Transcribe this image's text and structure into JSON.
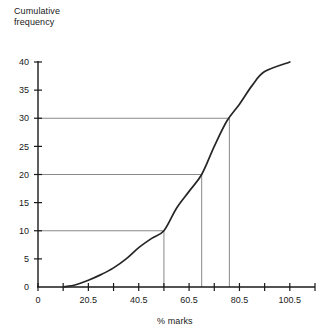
{
  "chart_data": {
    "type": "line",
    "title": "",
    "xlabel": "% marks",
    "ylabel": "Cumulative\nfrequency",
    "ylabel_line1": "Cumulative",
    "ylabel_line2": "frequency",
    "xlim": [
      0.5,
      110.5
    ],
    "ylim": [
      0,
      40
    ],
    "grid": false,
    "legend": null,
    "y_ticks": [
      0,
      5,
      10,
      15,
      20,
      25,
      30,
      35,
      40
    ],
    "y_tick_labels": [
      "0",
      "5",
      "10",
      "15",
      "20",
      "25",
      "30",
      "35",
      "40"
    ],
    "x_ticks": [
      0.5,
      10.5,
      20.5,
      30.5,
      40.5,
      50.5,
      60.5,
      70.5,
      80.5,
      90.5,
      100.5,
      110.5
    ],
    "x_tick_labels": [
      "0",
      "",
      "20.5",
      "",
      "40.5",
      "",
      "60.5",
      "",
      "80.5",
      "",
      "100.5",
      ""
    ],
    "x_labeled_ticks": [
      {
        "value": 0.5,
        "label": "0"
      },
      {
        "value": 20.5,
        "label": "20.5"
      },
      {
        "value": 40.5,
        "label": "40.5"
      },
      {
        "value": 60.5,
        "label": "60.5"
      },
      {
        "value": 80.5,
        "label": "80.5"
      },
      {
        "value": 100.5,
        "label": "100.5"
      }
    ],
    "series": [
      {
        "name": "Cumulative frequency curve",
        "x": [
          10.5,
          15.5,
          20.5,
          25.5,
          30.5,
          35.5,
          40.5,
          45.5,
          50.5,
          55.5,
          60.5,
          65.5,
          70.5,
          75.5,
          80.5,
          85.5,
          90.5,
          100.5
        ],
        "values": [
          0,
          0.4,
          1.2,
          2.2,
          3.4,
          5.0,
          7.0,
          8.6,
          10.0,
          14.0,
          17.0,
          20.0,
          25.0,
          29.5,
          32.5,
          35.8,
          38.3,
          40.0
        ]
      }
    ],
    "annotations": [
      {
        "name": "lower-quartile",
        "cf": 10,
        "marks": 50.5,
        "guide": "horizontal-to-curve-then-vertical-to-axis"
      },
      {
        "name": "median",
        "cf": 20,
        "marks": 65.5,
        "guide": "horizontal-to-curve-then-vertical-to-axis"
      },
      {
        "name": "upper-quartile",
        "cf": 30,
        "marks": 76.5,
        "guide": "horizontal-to-curve-then-vertical-to-axis"
      }
    ],
    "colors": {
      "axis": "#1a1a1a",
      "curve": "#262626",
      "guide": "#6b6b6b",
      "background": "#ffffff"
    }
  }
}
